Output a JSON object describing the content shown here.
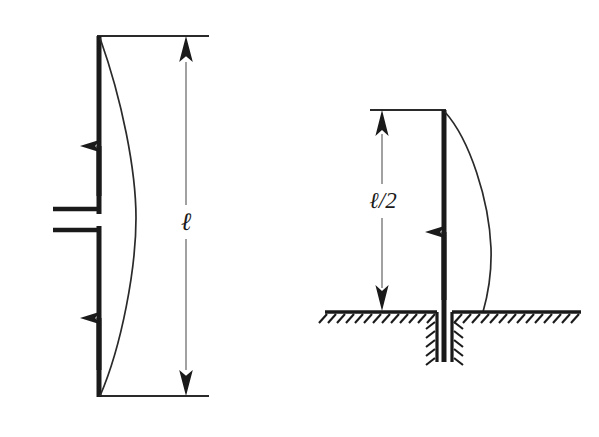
{
  "figure": {
    "background_color": "#ffffff",
    "ink_color": "#1a1a1a",
    "dimension_line_color": "#6e6e6e",
    "width": 599,
    "height": 437
  },
  "left_figure": {
    "name": "pinned-pinned-column",
    "dimension_label": "ℓ",
    "column": {
      "top_y": 36,
      "bottom_y": 396,
      "x": 99,
      "stroke_width": 5
    },
    "load_arrow_count": 2,
    "deflection_curve": {
      "bulge_direction": "right",
      "max_bulge_x": 136
    },
    "mid_support": {
      "type": "double-horizontal-channel",
      "y_top": 209,
      "y_bottom": 230,
      "x_start": 53,
      "x_end": 99
    },
    "top_extension_line": {
      "x1": 99,
      "x2": 208,
      "y": 36
    },
    "bottom_extension_line": {
      "x1": 99,
      "x2": 208,
      "y": 396
    },
    "dimension_line": {
      "x": 186,
      "y_top": 36,
      "y_bottom": 396
    },
    "label_position": {
      "x": 186,
      "y": 228
    }
  },
  "right_figure": {
    "name": "fixed-base-column",
    "dimension_label": "ℓ/2",
    "column": {
      "top_y": 110,
      "ground_y": 312,
      "embedded_bottom_y": 362,
      "x": 444,
      "stroke_width": 5
    },
    "load_arrow_count": 1,
    "deflection_curve": {
      "bulge_direction": "right",
      "max_bulge_x": 491
    },
    "ground": {
      "type": "hatched-foundation",
      "y": 312,
      "x_left": 325,
      "x_right": 580,
      "slot_left_x": 437,
      "slot_right_x": 452,
      "slot_depth_y": 362,
      "hatch_side": "below"
    },
    "top_extension_line": {
      "x1": 371,
      "x2": 444,
      "y": 110
    },
    "dimension_line": {
      "x": 382,
      "y_top": 110,
      "y_bottom": 312
    },
    "label_position": {
      "x": 382,
      "y": 205
    }
  }
}
